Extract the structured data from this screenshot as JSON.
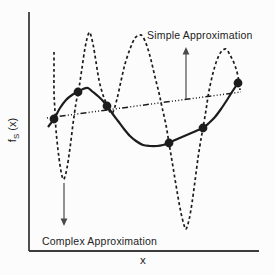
{
  "figure": {
    "background": "#fcfcfc",
    "ink_color": "#1c1c1c",
    "axis_color": "#3c3c3c",
    "arrow_color": "#4a4a4a"
  },
  "labels": {
    "simple_annotation": "Simple Approximation",
    "complex_annotation": "Complex Approximation",
    "x_axis": "x",
    "y_axis": {
      "base": "f",
      "sub": "S",
      "rest": " (x)"
    }
  },
  "chart_data": {
    "type": "line",
    "title": "",
    "xlabel": "x",
    "ylabel": "fS(x)",
    "axes": {
      "y_axis_x_px": 29,
      "y_top_px": 12,
      "x_axis_y_px": 251,
      "x_right_px": 259,
      "grid": false
    },
    "data_points_px": [
      [
        54,
        119
      ],
      [
        78,
        92
      ],
      [
        107,
        106
      ],
      [
        169,
        143
      ],
      [
        203,
        128
      ],
      [
        238,
        83
      ]
    ],
    "point_radius_px": 4.4,
    "series": [
      {
        "name": "Complex Approximation",
        "style": "dashed",
        "points_px": [
          [
            54,
            52
          ],
          [
            54,
            72
          ],
          [
            54,
            92
          ],
          [
            55,
            112
          ],
          [
            56,
            130
          ],
          [
            58,
            150
          ],
          [
            60,
            165
          ],
          [
            62,
            176
          ],
          [
            64,
            179
          ],
          [
            67,
            168
          ],
          [
            70,
            148
          ],
          [
            73,
            124
          ],
          [
            76,
            103
          ],
          [
            79,
            88
          ],
          [
            82,
            68
          ],
          [
            85,
            48
          ],
          [
            88,
            35
          ],
          [
            90,
            33
          ],
          [
            93,
            44
          ],
          [
            96,
            62
          ],
          [
            99,
            80
          ],
          [
            103,
            95
          ],
          [
            107,
            105
          ],
          [
            110,
            112
          ],
          [
            113,
            112
          ],
          [
            117,
            99
          ],
          [
            121,
            81
          ],
          [
            125,
            64
          ],
          [
            130,
            49
          ],
          [
            135,
            38
          ],
          [
            140,
            35
          ],
          [
            143,
            37
          ],
          [
            147,
            46
          ],
          [
            151,
            60
          ],
          [
            155,
            77
          ],
          [
            159,
            93
          ],
          [
            162,
            107
          ],
          [
            166,
            125
          ],
          [
            169,
            143
          ],
          [
            172,
            161
          ],
          [
            175,
            179
          ],
          [
            178,
            197
          ],
          [
            181,
            213
          ],
          [
            184,
            225
          ],
          [
            186,
            229
          ],
          [
            189,
            220
          ],
          [
            192,
            203
          ],
          [
            195,
            181
          ],
          [
            198,
            158
          ],
          [
            201,
            139
          ],
          [
            203,
            128
          ],
          [
            206,
            110
          ],
          [
            209,
            91
          ],
          [
            213,
            73
          ],
          [
            217,
            60
          ],
          [
            221,
            52
          ],
          [
            226,
            49
          ],
          [
            230,
            55
          ],
          [
            234,
            63
          ],
          [
            237,
            72
          ],
          [
            239,
            82
          ],
          [
            240,
            90
          ]
        ]
      },
      {
        "name": "Sample curve through data points",
        "style": "solid",
        "points_px": [
          [
            48,
            127
          ],
          [
            54,
            119
          ],
          [
            60,
            108
          ],
          [
            66,
            100
          ],
          [
            72,
            95
          ],
          [
            78,
            92
          ],
          [
            83,
            89
          ],
          [
            88,
            88
          ],
          [
            93,
            92
          ],
          [
            99,
            97
          ],
          [
            103,
            101
          ],
          [
            107,
            106
          ],
          [
            112,
            113
          ],
          [
            118,
            121
          ],
          [
            124,
            129
          ],
          [
            130,
            136
          ],
          [
            136,
            141
          ],
          [
            143,
            145
          ],
          [
            150,
            146
          ],
          [
            157,
            146
          ],
          [
            163,
            145
          ],
          [
            169,
            143
          ],
          [
            175,
            140
          ],
          [
            182,
            137
          ],
          [
            189,
            134
          ],
          [
            196,
            131
          ],
          [
            203,
            128
          ],
          [
            209,
            123
          ],
          [
            215,
            117
          ],
          [
            221,
            109
          ],
          [
            227,
            100
          ],
          [
            232,
            92
          ],
          [
            238,
            83
          ]
        ]
      },
      {
        "name": "Simple Approximation",
        "style": "dash-dot",
        "points_px": [
          [
            47,
            118
          ],
          [
            241,
            92
          ]
        ]
      }
    ],
    "annotations": [
      {
        "text": "Simple Approximation",
        "arrow": {
          "x": 186,
          "from_y": 99,
          "to_y": 47,
          "direction": "up"
        }
      },
      {
        "text": "Complex Approximation",
        "arrow": {
          "x": 64,
          "from_y": 183,
          "to_y": 226,
          "direction": "down"
        }
      }
    ],
    "legend_position": "none"
  }
}
